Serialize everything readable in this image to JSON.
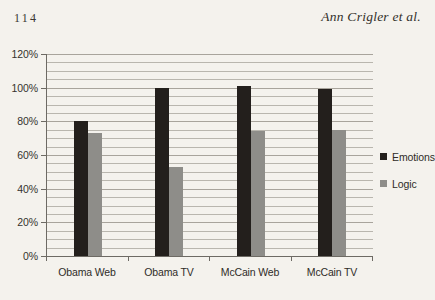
{
  "running_head": {
    "page_number": "114",
    "author_line": "Ann Crigler et al."
  },
  "chart_data": {
    "type": "bar",
    "title": "",
    "subtitle": "",
    "xlabel": "",
    "ylabel": "",
    "categories": [
      "Obama Web",
      "Obama TV",
      "McCain Web",
      "McCain TV"
    ],
    "series": [
      {
        "name": "Emotions",
        "color": "#231f1c",
        "values": [
          80,
          100,
          101,
          99
        ]
      },
      {
        "name": "Logic",
        "color": "#8e8d89",
        "values": [
          73,
          53,
          74,
          75
        ]
      }
    ],
    "ylim": [
      0,
      120
    ],
    "y_ticks": [
      0,
      20,
      40,
      60,
      80,
      100,
      120
    ],
    "y_tick_labels": [
      "0%",
      "20%",
      "40%",
      "60%",
      "80%",
      "100%",
      "120%"
    ],
    "y_minor_tick_step": 5,
    "grid": true,
    "grid_axis": "y",
    "legend_position": "right",
    "legend": [
      "Emotions",
      "Logic"
    ]
  }
}
